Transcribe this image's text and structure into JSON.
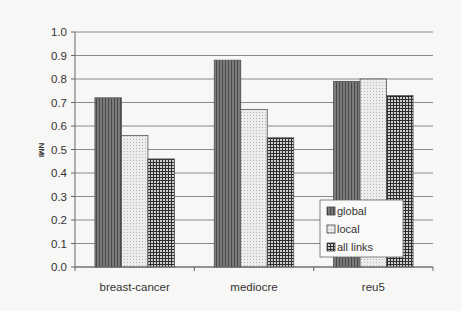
{
  "chart_data": {
    "type": "bar",
    "title": "",
    "xlabel": "",
    "ylabel": "NMI",
    "ylim": [
      0.0,
      1.0
    ],
    "yticks": [
      "0.0",
      "0.1",
      "0.2",
      "0.3",
      "0.4",
      "0.5",
      "0.6",
      "0.7",
      "0.8",
      "0.9",
      "1.0"
    ],
    "grid": true,
    "legend_position": "lower right (inside plot)",
    "categories": [
      "breast-cancer",
      "mediocre",
      "reu5"
    ],
    "series": [
      {
        "name": "global",
        "values": [
          0.72,
          0.88,
          0.79
        ],
        "pattern": "dark vertical stripes",
        "color": "#6e6e6e"
      },
      {
        "name": "local",
        "values": [
          0.56,
          0.67,
          0.8
        ],
        "pattern": "light dotted",
        "color": "#e2e2e0"
      },
      {
        "name": "all links",
        "values": [
          0.46,
          0.55,
          0.73
        ],
        "pattern": "dark grid",
        "color": "#3a3a3a"
      }
    ]
  },
  "axis": {
    "y_title": "NMI"
  },
  "legend": {
    "items": [
      "global",
      "local",
      "all links"
    ]
  }
}
